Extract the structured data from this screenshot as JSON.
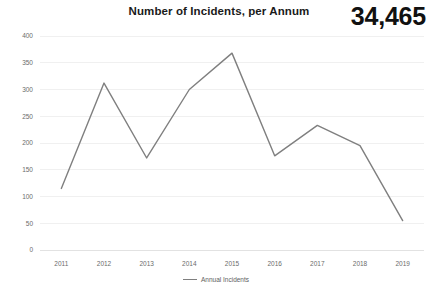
{
  "header": {
    "title": "Number of Incidents, per Annum",
    "kpi_value": "34,465"
  },
  "legend": {
    "label": "Annual Incidents",
    "swatch_color": "#7f7f7f",
    "position": "bottom-center"
  },
  "axis": {
    "y_ticks": [
      "0",
      "50",
      "100",
      "150",
      "200",
      "250",
      "300",
      "350",
      "400"
    ],
    "x_ticks": [
      "2011",
      "2012",
      "2013",
      "2014",
      "2015",
      "2016",
      "2017",
      "2018",
      "2019"
    ]
  },
  "chart_data": {
    "type": "line",
    "title": "Number of Incidents, per Annum",
    "xlabel": "",
    "ylabel": "",
    "categories": [
      "2011",
      "2012",
      "2013",
      "2014",
      "2015",
      "2016",
      "2017",
      "2018",
      "2019"
    ],
    "series": [
      {
        "name": "Annual Incidents",
        "color": "#7f7f7f",
        "values": [
          115,
          312,
          172,
          300,
          368,
          176,
          233,
          195,
          55
        ]
      }
    ],
    "ylim": [
      0,
      400
    ],
    "ytick_step": 50,
    "grid": true,
    "grid_axis": "y",
    "legend": true,
    "legend_position": "bottom-center",
    "annotations": [
      {
        "name": "kpi-total",
        "text": "34,465"
      }
    ]
  }
}
